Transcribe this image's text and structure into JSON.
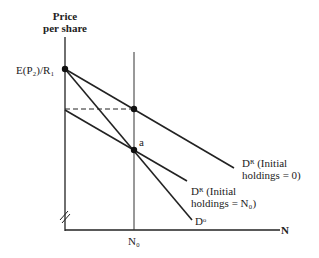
{
  "diagram": {
    "y_axis_label_line1": "Price",
    "y_axis_label_line2": "per share",
    "x_axis_label": "N",
    "y_tick_label": "E(P₂)/R₁",
    "x_tick_label": "N₀",
    "point_label": "a",
    "curves": [
      {
        "name": "DR-initial-0",
        "label_line1": "Dᴿ (Initial",
        "label_line2": "holdings = 0)"
      },
      {
        "name": "DR-initial-N0",
        "label_line1": "Dᴿ (Initial",
        "label_line2": "holdings = N₀)"
      },
      {
        "name": "Do",
        "label": "Dᵒ"
      }
    ],
    "colors": {
      "line": "#222222",
      "background": "#ffffff"
    }
  }
}
